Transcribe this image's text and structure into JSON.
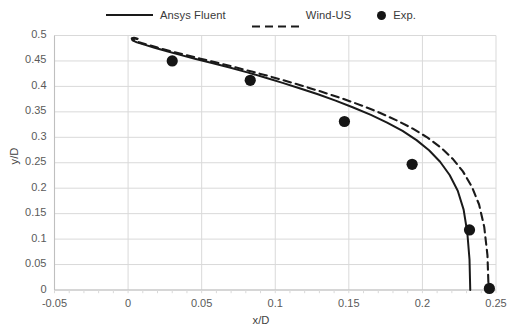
{
  "chart_data": {
    "type": "line",
    "title": "",
    "xlabel": "x/D",
    "ylabel": "y/D",
    "xlim": [
      -0.05,
      0.25
    ],
    "ylim": [
      0,
      0.5
    ],
    "xticks": [
      "-0.05",
      "0",
      "0.05",
      "0.1",
      "0.15",
      "0.2",
      "0.25"
    ],
    "yticks": [
      "0",
      "0.05",
      "0.1",
      "0.15",
      "0.2",
      "0.25",
      "0.3",
      "0.35",
      "0.4",
      "0.45",
      "0.5"
    ],
    "xtick_values": [
      -0.05,
      0,
      0.05,
      0.1,
      0.15,
      0.2,
      0.25
    ],
    "ytick_values": [
      0,
      0.05,
      0.1,
      0.15,
      0.2,
      0.25,
      0.3,
      0.35,
      0.4,
      0.45,
      0.5
    ],
    "grid": "both",
    "legend_position": "top-center",
    "series": [
      {
        "name": "Ansys Fluent",
        "style": "solid",
        "color": "#1a1a1a",
        "x": [
          0.0065,
          0.004,
          0.0025,
          0.003,
          0.006,
          0.011,
          0.018,
          0.0265,
          0.036,
          0.046,
          0.057,
          0.069,
          0.081,
          0.093,
          0.105,
          0.117,
          0.129,
          0.141,
          0.153,
          0.165,
          0.176,
          0.1865,
          0.196,
          0.2045,
          0.212,
          0.2185,
          0.224,
          0.228,
          0.2305,
          0.232,
          0.2325
        ],
        "y": [
          0.4935,
          0.4955,
          0.494,
          0.4905,
          0.4865,
          0.482,
          0.476,
          0.469,
          0.4615,
          0.454,
          0.446,
          0.437,
          0.4275,
          0.4175,
          0.407,
          0.396,
          0.3845,
          0.372,
          0.3585,
          0.344,
          0.329,
          0.3125,
          0.2945,
          0.2745,
          0.252,
          0.226,
          0.195,
          0.158,
          0.113,
          0.06,
          0.0
        ]
      },
      {
        "name": "Wind-US",
        "style": "dashed",
        "color": "#1a1a1a",
        "x": [
          0.006,
          0.0038,
          0.0028,
          0.004,
          0.0075,
          0.013,
          0.02,
          0.0285,
          0.038,
          0.0485,
          0.0595,
          0.0715,
          0.084,
          0.0965,
          0.109,
          0.1215,
          0.134,
          0.1465,
          0.159,
          0.171,
          0.1825,
          0.1935,
          0.2035,
          0.2125,
          0.2205,
          0.2275,
          0.2335,
          0.2385,
          0.242,
          0.2442,
          0.245
        ],
        "y": [
          0.493,
          0.4952,
          0.494,
          0.4905,
          0.4865,
          0.482,
          0.4762,
          0.4695,
          0.4625,
          0.455,
          0.4472,
          0.4385,
          0.4292,
          0.4195,
          0.4092,
          0.3985,
          0.3872,
          0.3752,
          0.3622,
          0.3482,
          0.3332,
          0.317,
          0.2995,
          0.28,
          0.258,
          0.233,
          0.2035,
          0.168,
          0.124,
          0.068,
          0.0
        ]
      }
    ],
    "scatter": [
      {
        "name": "Exp.",
        "marker": "circle",
        "color": "#151515",
        "points": [
          {
            "x": 0.03,
            "y": 0.45
          },
          {
            "x": 0.083,
            "y": 0.412
          },
          {
            "x": 0.147,
            "y": 0.331
          },
          {
            "x": 0.193,
            "y": 0.247
          },
          {
            "x": 0.232,
            "y": 0.118
          },
          {
            "x": 0.2455,
            "y": 0.003
          }
        ]
      }
    ]
  },
  "legend": {
    "entries": [
      {
        "label": "Ansys Fluent",
        "style": "solid"
      },
      {
        "label": "Wind-US",
        "style": "dashed"
      },
      {
        "label": "Exp.",
        "style": "marker"
      }
    ]
  },
  "colors": {
    "grid": "#d9d9d9",
    "axis": "#bfbfbf",
    "curve": "#1a1a1a",
    "marker": "#151515",
    "tick_text": "#5a5a5a",
    "title_text": "#3f3f3f",
    "background": "#ffffff"
  }
}
